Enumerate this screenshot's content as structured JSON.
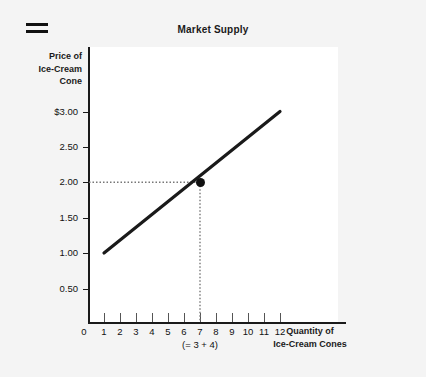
{
  "header": {
    "menu_icon": "hamburger-menu-icon",
    "title": "Market Supply"
  },
  "axes": {
    "y_title_line1": "Price of",
    "y_title_line2": "Ice-Cream",
    "y_title_line3": "Cone",
    "x_title_line1": "Quantity of",
    "x_title_line2": "Ice-Cream Cones",
    "x_origin": "0",
    "quantity_note": "(= 3 + 4)"
  },
  "chart_data": {
    "type": "line",
    "title": "Market Supply",
    "xlabel": "Quantity of Ice-Cream Cones",
    "ylabel": "Price of Ice-Cream Cone",
    "xlim": [
      0,
      13
    ],
    "ylim": [
      0,
      3.25
    ],
    "grid": false,
    "legend": "none",
    "x_ticks": [
      0,
      1,
      2,
      3,
      4,
      5,
      6,
      7,
      8,
      9,
      10,
      11,
      12
    ],
    "x_tick_labels": [
      "0",
      "1",
      "2",
      "3",
      "4",
      "5",
      "6",
      "7",
      "8",
      "9",
      "10",
      "11",
      "12"
    ],
    "y_ticks": [
      0.5,
      1.0,
      1.5,
      2.0,
      2.5,
      3.0
    ],
    "y_tick_labels": [
      "0.50",
      "1.00",
      "1.50",
      "2.00",
      "2.50",
      "$3.00"
    ],
    "series": [
      {
        "name": "Supply",
        "type": "line",
        "color": "#1a1a1a",
        "x": [
          1,
          12
        ],
        "y": [
          1.0,
          3.0
        ]
      }
    ],
    "annotations": [
      {
        "name": "equilibrium-point",
        "x": 7,
        "y": 2.0,
        "label": "(= 3 + 4)",
        "guides": [
          "horizontal-dotted-to-y-axis",
          "vertical-dotted-to-x-axis"
        ]
      }
    ]
  },
  "colors": {
    "background": "#f4f4f4",
    "plot_background": "#ffffff",
    "axis": "#1a1a1a",
    "line": "#1a1a1a",
    "guide": "#777777"
  }
}
